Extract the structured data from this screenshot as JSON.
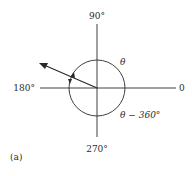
{
  "figure": {
    "caption": "(a)",
    "labels": {
      "top": "90°",
      "bottom": "270°",
      "left": "180°",
      "right": "0",
      "theta": "θ",
      "theta_minus": "θ − 360°"
    },
    "colors": {
      "stroke": "#2a2a2a",
      "background": "#ffffff"
    }
  }
}
